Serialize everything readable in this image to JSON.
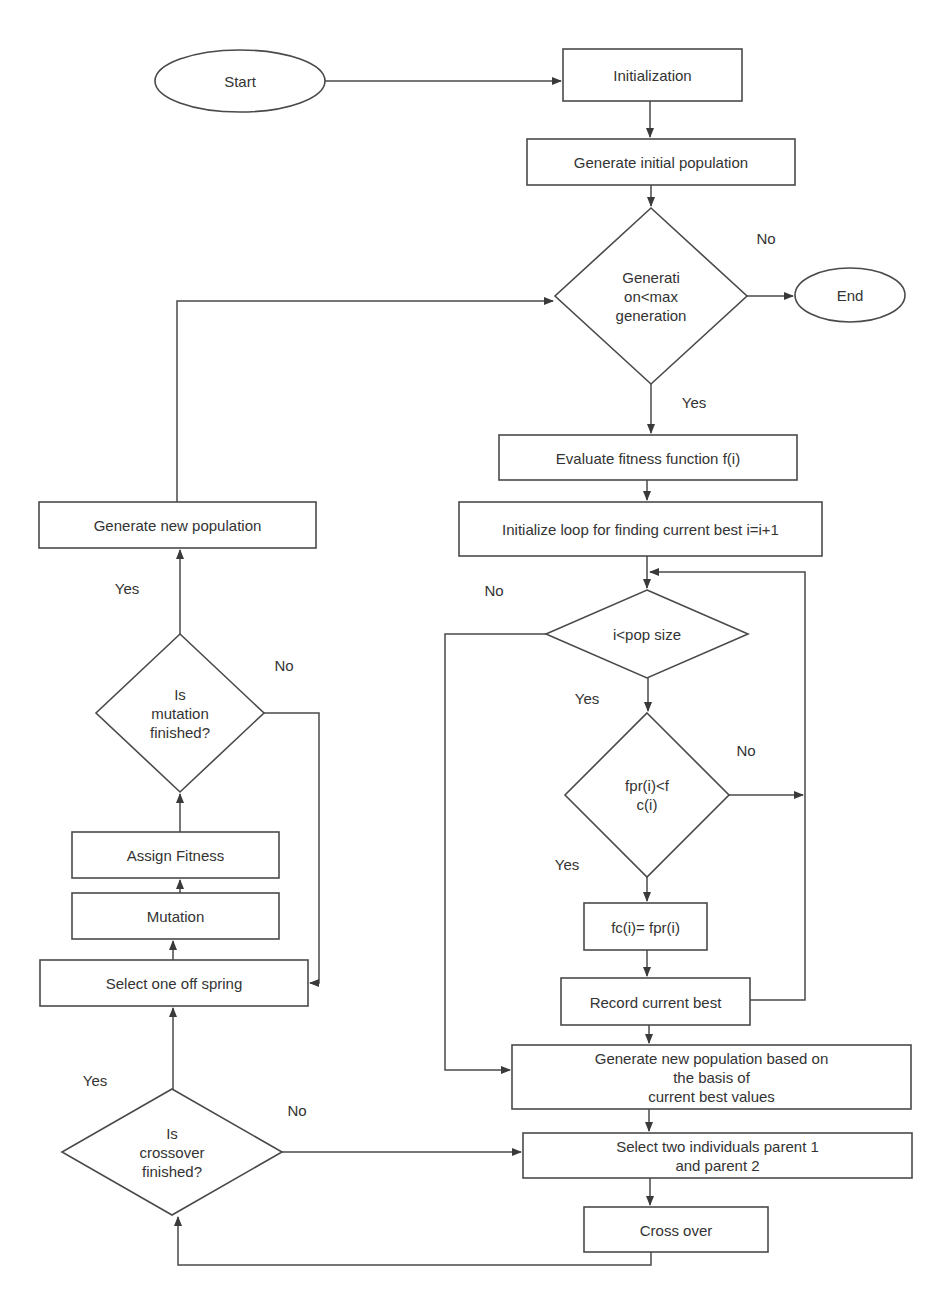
{
  "diagram": {
    "type": "flowchart",
    "colors": {
      "stroke": "#4a4a4a",
      "text": "#333333",
      "background": "#ffffff"
    },
    "nodes": [
      {
        "id": "start",
        "shape": "ellipse",
        "label": "Start",
        "x": 155,
        "y": 50,
        "w": 170,
        "h": 62
      },
      {
        "id": "initialization",
        "shape": "rect",
        "label": "Initialization",
        "x": 563,
        "y": 49,
        "w": 179,
        "h": 52
      },
      {
        "id": "gen_initial_pop",
        "shape": "rect",
        "label": "Generate initial population",
        "x": 527,
        "y": 139,
        "w": 268,
        "h": 46
      },
      {
        "id": "gen_check",
        "shape": "diamond",
        "label": "Generati\non<max\ngeneration",
        "cx": 651,
        "cy": 296,
        "hw": 96,
        "hh": 88
      },
      {
        "id": "end",
        "shape": "ellipse",
        "label": "End",
        "x": 795,
        "y": 268,
        "w": 110,
        "h": 54
      },
      {
        "id": "evaluate",
        "shape": "rect",
        "label": "Evaluate fitness function f(i)",
        "x": 499,
        "y": 435,
        "w": 298,
        "h": 45
      },
      {
        "id": "init_loop",
        "shape": "rect",
        "label": "Initialize loop for finding current best i=i+1",
        "x": 459,
        "y": 502,
        "w": 363,
        "h": 54
      },
      {
        "id": "pop_check",
        "shape": "diamond",
        "label": "i<pop size",
        "cx": 647,
        "cy": 634,
        "hw": 101,
        "hh": 44
      },
      {
        "id": "fit_check",
        "shape": "diamond",
        "label": "fpr(i)<f\nc(i)",
        "cx": 647,
        "cy": 795,
        "hw": 82,
        "hh": 82
      },
      {
        "id": "assign_fc",
        "shape": "rect",
        "label": "fc(i)= fpr(i)",
        "x": 584,
        "y": 903,
        "w": 123,
        "h": 47
      },
      {
        "id": "record_best",
        "shape": "rect",
        "label": "Record current best",
        "x": 561,
        "y": 978,
        "w": 189,
        "h": 47
      },
      {
        "id": "gen_new_pop_best",
        "shape": "rect",
        "label": "Generate new population based on the basis of\ncurrent best values",
        "x": 512,
        "y": 1045,
        "w": 399,
        "h": 64
      },
      {
        "id": "select_parents",
        "shape": "rect",
        "label": "Select two individuals parent 1 and parent 2",
        "x": 523,
        "y": 1133,
        "w": 389,
        "h": 45
      },
      {
        "id": "cross_over",
        "shape": "rect",
        "label": "Cross over",
        "x": 584,
        "y": 1207,
        "w": 184,
        "h": 45
      },
      {
        "id": "crossover_check",
        "shape": "diamond",
        "label": "Is\ncrossover\nfinished?",
        "cx": 172,
        "cy": 1152,
        "hw": 110,
        "hh": 63
      },
      {
        "id": "select_offspring",
        "shape": "rect",
        "label": "Select one off spring",
        "x": 40,
        "y": 960,
        "w": 268,
        "h": 46
      },
      {
        "id": "mutation",
        "shape": "rect",
        "label": "Mutation",
        "x": 72,
        "y": 893,
        "w": 207,
        "h": 46
      },
      {
        "id": "assign_fitness",
        "shape": "rect",
        "label": "Assign Fitness",
        "x": 72,
        "y": 832,
        "w": 207,
        "h": 46
      },
      {
        "id": "mutation_check",
        "shape": "diamond",
        "label": "Is\nmutation\nfinished?",
        "cx": 180,
        "cy": 713,
        "hw": 84,
        "hh": 79
      },
      {
        "id": "gen_new_pop",
        "shape": "rect",
        "label": "Generate new population",
        "x": 39,
        "y": 502,
        "w": 277,
        "h": 46
      }
    ],
    "connectors": [
      {
        "from": "start",
        "to": "initialization",
        "points": [
          [
            325,
            81
          ],
          [
            561,
            81
          ]
        ],
        "arrow": true
      },
      {
        "from": "initialization",
        "to": "gen_initial_pop",
        "points": [
          [
            650,
            101
          ],
          [
            650,
            137
          ]
        ],
        "arrow": true
      },
      {
        "from": "gen_initial_pop",
        "to": "gen_check",
        "points": [
          [
            651,
            185
          ],
          [
            651,
            206
          ]
        ],
        "arrow": true
      },
      {
        "from": "gen_check",
        "to": "end",
        "label": "No",
        "points": [
          [
            747,
            296
          ],
          [
            793,
            296
          ]
        ],
        "arrow": true
      },
      {
        "from": "gen_check",
        "to": "evaluate",
        "label": "Yes",
        "points": [
          [
            651,
            384
          ],
          [
            651,
            433
          ]
        ],
        "arrow": true
      },
      {
        "from": "evaluate",
        "to": "init_loop",
        "points": [
          [
            647,
            480
          ],
          [
            647,
            500
          ]
        ],
        "arrow": true
      },
      {
        "from": "init_loop",
        "to": "pop_check",
        "points": [
          [
            647,
            556
          ],
          [
            647,
            588
          ]
        ],
        "arrow": true
      },
      {
        "from": "pop_check",
        "to": "gen_new_pop_best",
        "label": "No",
        "points": [
          [
            546,
            634
          ],
          [
            445,
            634
          ],
          [
            445,
            1070
          ],
          [
            510,
            1070
          ]
        ],
        "arrow": true
      },
      {
        "from": "pop_check",
        "to": "fit_check",
        "label": "Yes",
        "points": [
          [
            648,
            678
          ],
          [
            648,
            711
          ]
        ],
        "arrow": true
      },
      {
        "from": "fit_check",
        "to": "loop_back",
        "label": "No",
        "points": [
          [
            729,
            795
          ],
          [
            803,
            795
          ]
        ],
        "arrow": true
      },
      {
        "from": "fit_check",
        "to": "assign_fc",
        "label": "Yes",
        "points": [
          [
            647,
            877
          ],
          [
            647,
            901
          ]
        ],
        "arrow": true
      },
      {
        "from": "assign_fc",
        "to": "record_best",
        "points": [
          [
            647,
            950
          ],
          [
            647,
            976
          ]
        ],
        "arrow": true
      },
      {
        "from": "record_best",
        "to": "pop_check",
        "points": [
          [
            750,
            1000
          ],
          [
            805,
            1000
          ],
          [
            805,
            572
          ],
          [
            650,
            572
          ]
        ],
        "arrow": true
      },
      {
        "from": "record_best",
        "to": "gen_new_pop_best",
        "points": [
          [
            649,
            1025
          ],
          [
            649,
            1043
          ]
        ],
        "arrow": true
      },
      {
        "from": "gen_new_pop_best",
        "to": "select_parents",
        "points": [
          [
            649,
            1109
          ],
          [
            649,
            1131
          ]
        ],
        "arrow": true
      },
      {
        "from": "select_parents",
        "to": "cross_over",
        "points": [
          [
            650,
            1178
          ],
          [
            650,
            1205
          ]
        ],
        "arrow": true
      },
      {
        "from": "cross_over",
        "to": "crossover_check",
        "points": [
          [
            651,
            1252
          ],
          [
            651,
            1265
          ],
          [
            178,
            1265
          ],
          [
            178,
            1217
          ]
        ],
        "arrow": true
      },
      {
        "from": "crossover_check",
        "to": "select_parents",
        "label": "No",
        "points": [
          [
            282,
            1152
          ],
          [
            521,
            1152
          ]
        ],
        "arrow": true
      },
      {
        "from": "crossover_check",
        "to": "select_offspring",
        "label": "Yes",
        "points": [
          [
            173,
            1089
          ],
          [
            173,
            1008
          ]
        ],
        "arrow": true
      },
      {
        "from": "select_offspring",
        "to": "mutation",
        "points": [
          [
            173,
            960
          ],
          [
            173,
            941
          ]
        ],
        "arrow": true
      },
      {
        "from": "mutation",
        "to": "assign_fitness",
        "points": [
          [
            180,
            893
          ],
          [
            180,
            880
          ]
        ],
        "arrow": true
      },
      {
        "from": "assign_fitness",
        "to": "mutation_check",
        "points": [
          [
            180,
            832
          ],
          [
            180,
            794
          ]
        ],
        "arrow": true
      },
      {
        "from": "mutation_check",
        "to": "select_offspring",
        "label": "No",
        "points": [
          [
            263,
            713
          ],
          [
            319,
            713
          ],
          [
            319,
            983
          ],
          [
            310,
            983
          ]
        ],
        "arrow": true
      },
      {
        "from": "mutation_check",
        "to": "gen_new_pop",
        "label": "Yes",
        "points": [
          [
            180,
            634
          ],
          [
            180,
            550
          ]
        ],
        "arrow": true
      },
      {
        "from": "gen_new_pop",
        "to": "gen_check",
        "points": [
          [
            177,
            502
          ],
          [
            177,
            301
          ],
          [
            553,
            301
          ]
        ],
        "arrow": true
      }
    ],
    "edge_labels": [
      {
        "text": "No",
        "x": 766,
        "y": 238
      },
      {
        "text": "Yes",
        "x": 694,
        "y": 402
      },
      {
        "text": "No",
        "x": 494,
        "y": 590
      },
      {
        "text": "Yes",
        "x": 587,
        "y": 698
      },
      {
        "text": "No",
        "x": 746,
        "y": 750
      },
      {
        "text": "Yes",
        "x": 567,
        "y": 864
      },
      {
        "text": "Yes",
        "x": 127,
        "y": 588
      },
      {
        "text": "No",
        "x": 284,
        "y": 665
      },
      {
        "text": "Yes",
        "x": 95,
        "y": 1080
      },
      {
        "text": "No",
        "x": 297,
        "y": 1110
      }
    ]
  }
}
